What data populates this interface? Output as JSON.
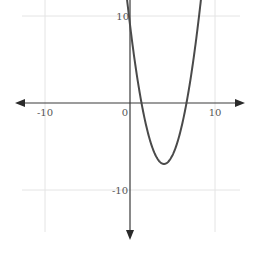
{
  "chart_data": {
    "type": "line",
    "title": "",
    "xlabel": "",
    "ylabel": "",
    "function": "y = (x - 4)^2 - 7",
    "xlim": [
      -13.3,
      13.5
    ],
    "ylim": [
      -15.5,
      11.8
    ],
    "grid": true,
    "x_ticks": [
      -10,
      0,
      10
    ],
    "y_ticks": [
      10,
      -10
    ],
    "tick_labels": {
      "x_neg": "-10",
      "origin": "0",
      "x_pos": "10",
      "y_pos": "10",
      "y_neg": "-10"
    },
    "vertex": [
      4,
      -7
    ],
    "y_intercept": 9,
    "x_intercepts": [
      1.35,
      6.65
    ],
    "series": [
      {
        "name": "parabola",
        "x": [
          -0.5,
          0,
          1,
          2,
          3,
          4,
          5,
          6,
          7,
          8,
          8.5
        ],
        "y": [
          13.25,
          9,
          2,
          -3,
          -6,
          -7,
          -6,
          -3,
          2,
          9,
          13.25
        ]
      }
    ],
    "colors": {
      "curve": "#4a4a4a",
      "axis": "#3a3a3a",
      "grid": "#e4e4e4"
    }
  }
}
